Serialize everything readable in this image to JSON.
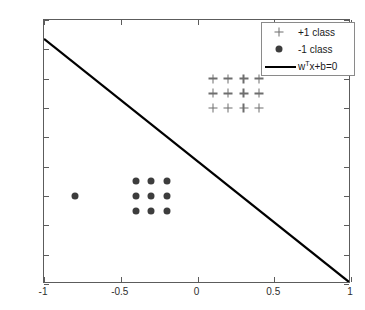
{
  "chart_data": {
    "type": "scatter",
    "title": "",
    "xlabel": "",
    "ylabel": "",
    "xlim": [
      -1,
      1
    ],
    "ylim": [
      -1,
      0.8
    ],
    "grid": false,
    "legend_position": "top-right",
    "xticks": [
      "-1",
      "-0.5",
      "0",
      "0.5",
      "1"
    ],
    "xtick_values": [
      -1,
      -0.5,
      0,
      0.5,
      1
    ],
    "yticks": [
      "0.8",
      "0.6",
      "0.4",
      "0.2",
      "0",
      "-0.2",
      "-0.4",
      "-0.6",
      "-0.8",
      "-1"
    ],
    "ytick_values": [
      0.8,
      0.6,
      0.4,
      0.2,
      0,
      -0.2,
      -0.4,
      -0.6,
      -0.8,
      -1
    ],
    "series": [
      {
        "name": "+1 class",
        "marker": "plus",
        "color": "#6e6e6e",
        "points": [
          [
            0.1,
            0.4
          ],
          [
            0.2,
            0.4
          ],
          [
            0.3,
            0.4
          ],
          [
            0.4,
            0.4
          ],
          [
            0.1,
            0.3
          ],
          [
            0.2,
            0.3
          ],
          [
            0.3,
            0.3
          ],
          [
            0.4,
            0.3
          ],
          [
            0.1,
            0.2
          ],
          [
            0.2,
            0.2
          ],
          [
            0.3,
            0.2
          ],
          [
            0.4,
            0.2
          ]
        ]
      },
      {
        "name": "-1 class",
        "marker": "circle",
        "color": "#3d3d3d",
        "points": [
          [
            -0.8,
            -0.4
          ],
          [
            -0.4,
            -0.3
          ],
          [
            -0.3,
            -0.3
          ],
          [
            -0.2,
            -0.3
          ],
          [
            -0.4,
            -0.4
          ],
          [
            -0.3,
            -0.4
          ],
          [
            -0.2,
            -0.4
          ],
          [
            -0.4,
            -0.5
          ],
          [
            -0.3,
            -0.5
          ],
          [
            -0.2,
            -0.5
          ]
        ]
      }
    ],
    "lines": [
      {
        "name": "decision-boundary",
        "label": "w^T x+b=0",
        "color": "#000000",
        "width": 2,
        "x": [
          -1,
          1
        ],
        "y": [
          0.67,
          -1
        ]
      }
    ]
  },
  "legend": {
    "items": [
      {
        "symbol": "plus-marker",
        "label": "+1 class"
      },
      {
        "symbol": "circle-marker",
        "label": "-1 class"
      },
      {
        "symbol": "line-sample",
        "label_prefix": "w",
        "label_sup": "T",
        "label_suffix": "x+b=0"
      }
    ]
  },
  "axes": {
    "frame_color": "#5c5c5c",
    "tick_label_color": "#2e2e2e"
  }
}
